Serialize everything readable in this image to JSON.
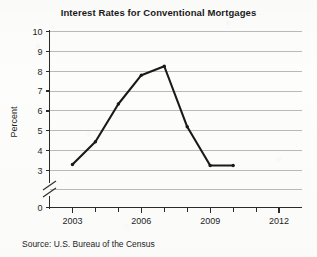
{
  "chart_data": {
    "type": "line",
    "title": "Interest Rates for Conventional Mortgages",
    "xlabel": "",
    "ylabel": "Percent",
    "x": [
      2003,
      2004,
      2005,
      2006,
      2007,
      2008,
      2009,
      2010
    ],
    "values": [
      3.3,
      4.45,
      6.35,
      7.8,
      8.25,
      5.2,
      3.25,
      3.25
    ],
    "series": [
      {
        "name": "Interest rate",
        "values": [
          3.3,
          4.45,
          6.35,
          7.8,
          8.25,
          5.2,
          3.25,
          3.25
        ]
      }
    ],
    "xlim": [
      2002,
      2013
    ],
    "ylim": [
      3,
      10
    ],
    "y_axis_broken": true,
    "y_break_between": [
      0,
      3
    ],
    "y_tick_labels": [
      "10",
      "9",
      "8",
      "7",
      "6",
      "5",
      "4",
      "3",
      "0"
    ],
    "y_ticks": [
      10,
      9,
      8,
      7,
      6,
      5,
      4,
      3,
      0
    ],
    "x_tick_labels": [
      "2003",
      "2006",
      "2009",
      "2012"
    ],
    "x_major_ticks": [
      2003,
      2006,
      2009,
      2012
    ],
    "x_minor_ticks": [
      2004,
      2005,
      2007,
      2008,
      2010,
      2011
    ],
    "grid": true,
    "grid_axis": "y",
    "legend": false,
    "line_color": "#1a1a1a",
    "grid_color": "#b9b9b9",
    "axis_color": "#2a2a2a",
    "background_color": "#fdfdfc"
  },
  "source": {
    "note": "Source: U.S. Bureau of the Census"
  }
}
